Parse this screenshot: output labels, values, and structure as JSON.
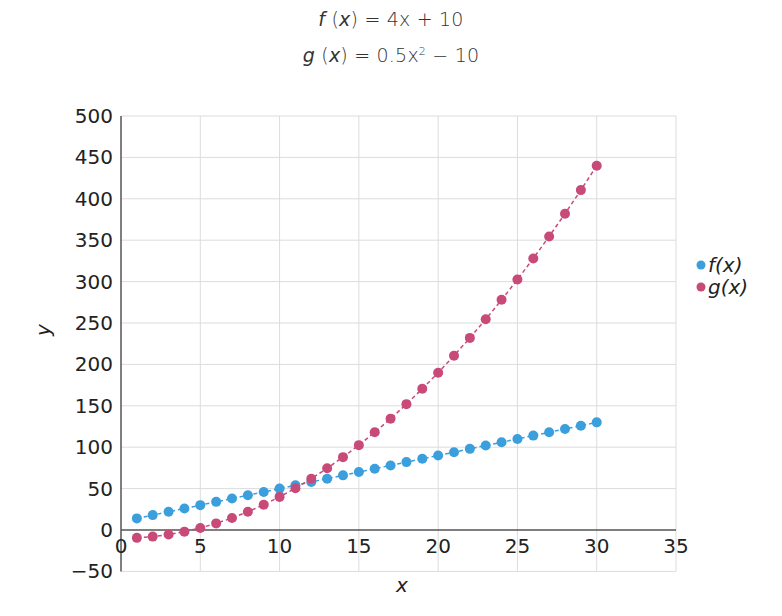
{
  "equations": {
    "f": {
      "name": "f",
      "arg": "x",
      "rhs": "4x + 10"
    },
    "g": {
      "name": "g",
      "arg": "x",
      "rhs_base": "0.5x",
      "rhs_exp": "2",
      "rhs_tail": " − 10"
    }
  },
  "colors": {
    "f": "#3a9fdc",
    "g": "#c84a78",
    "grid": "#dcdcdc",
    "axis": "#555555"
  },
  "chart_data": {
    "type": "line",
    "xlabel": "x",
    "ylabel": "y",
    "xlim": [
      0,
      35
    ],
    "ylim": [
      -50,
      500
    ],
    "xticks": [
      0,
      5,
      10,
      15,
      20,
      25,
      30,
      35
    ],
    "yticks": [
      -50,
      0,
      50,
      100,
      150,
      200,
      250,
      300,
      350,
      400,
      450,
      500
    ],
    "grid": true,
    "legend_position": "right",
    "x": [
      1,
      2,
      3,
      4,
      5,
      6,
      7,
      8,
      9,
      10,
      11,
      12,
      13,
      14,
      15,
      16,
      17,
      18,
      19,
      20,
      21,
      22,
      23,
      24,
      25,
      26,
      27,
      28,
      29,
      30
    ],
    "series": [
      {
        "name": "f(x)",
        "color": "#3a9fdc",
        "values": [
          14,
          18,
          22,
          26,
          30,
          34,
          38,
          42,
          46,
          50,
          54,
          58,
          62,
          66,
          70,
          74,
          78,
          82,
          86,
          90,
          94,
          98,
          102,
          106,
          110,
          114,
          118,
          122,
          126,
          130
        ]
      },
      {
        "name": "g(x)",
        "color": "#c84a78",
        "values": [
          -9.5,
          -8,
          -5.5,
          -2,
          2.5,
          8,
          14.5,
          22,
          30.5,
          40,
          50.5,
          62,
          74.5,
          88,
          102.5,
          118,
          134.5,
          152,
          170.5,
          190,
          210.5,
          232,
          254.5,
          278,
          302.5,
          328,
          354.5,
          382,
          410.5,
          440
        ]
      }
    ]
  }
}
